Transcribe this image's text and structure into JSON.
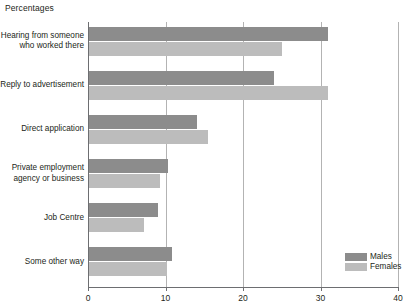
{
  "chart_data": {
    "type": "bar",
    "orientation": "horizontal",
    "title": "Percentages",
    "xlabel": "",
    "ylabel": "",
    "xlim": [
      0,
      40
    ],
    "xticks": [
      0,
      10,
      20,
      30,
      40
    ],
    "xtick_labels": [
      "0",
      "10",
      "20",
      "30",
      "40"
    ],
    "grid": true,
    "legend_position": "bottom-right",
    "categories": [
      "Hearing from someone who worked there",
      "Reply to advertisement",
      "Direct application",
      "Private employment agency or business",
      "Job Centre",
      "Some other way"
    ],
    "category_labels": [
      [
        "Hearing from someone",
        "who worked there"
      ],
      [
        "Reply to advertisement"
      ],
      [
        "Direct application"
      ],
      [
        "Private employment",
        "agency or business"
      ],
      [
        "Job Centre"
      ],
      [
        "Some other way"
      ]
    ],
    "series": [
      {
        "name": "Males",
        "color": "#8c8c8c",
        "values": [
          31,
          24,
          14,
          10.3,
          9,
          10.8
        ]
      },
      {
        "name": "Females",
        "color": "#bcbcbc",
        "values": [
          25,
          31,
          15.5,
          9.3,
          7.2,
          10.2
        ]
      }
    ]
  },
  "legend": {
    "items": [
      {
        "label": "Males",
        "color": "#8c8c8c"
      },
      {
        "label": "Females",
        "color": "#bcbcbc"
      }
    ]
  }
}
